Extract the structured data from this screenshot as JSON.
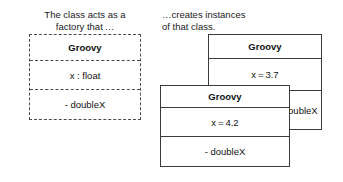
{
  "captions": {
    "left": "The class acts as a\nfactory that …",
    "right": "…creates instances\nof that class."
  },
  "class_box": {
    "name": "Groovy",
    "attribute": "x : float",
    "method": "- doubleX"
  },
  "instance_back": {
    "name": "Groovy",
    "attribute": "x = 3.7",
    "method": "- doubleX"
  },
  "instance_front": {
    "name": "Groovy",
    "attribute": "x = 4.2",
    "method": "- doubleX"
  },
  "colors": {
    "dashed_border": "#4a4a4a",
    "solid_border": "#3a3a3a",
    "text": "#111111",
    "background": "#ffffff"
  }
}
